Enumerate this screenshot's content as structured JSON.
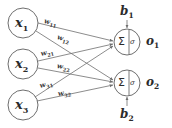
{
  "diagram": {
    "background_color": "#ffffff",
    "stroke_color": "#6e6e6e",
    "text_color": "#2b2b2b"
  },
  "inputs": [
    {
      "name": "input-x1",
      "label": "x",
      "sub": "1",
      "cx": 23,
      "cy": 23,
      "r": 15
    },
    {
      "name": "input-x2",
      "label": "x",
      "sub": "2",
      "cx": 23,
      "cy": 64,
      "r": 15
    },
    {
      "name": "input-x3",
      "label": "x",
      "sub": "3",
      "cx": 23,
      "cy": 105,
      "r": 15
    }
  ],
  "neurons": [
    {
      "name": "neuron-1",
      "sum_glyph": "Σ",
      "activation_glyph": "σ",
      "cx": 127,
      "cy": 42,
      "r": 13,
      "output_label": "o",
      "output_sub": "1",
      "bias_label": "b",
      "bias_sub": "1",
      "bias_position": "top"
    },
    {
      "name": "neuron-2",
      "sum_glyph": "Σ",
      "activation_glyph": "σ",
      "cx": 127,
      "cy": 83,
      "r": 13,
      "output_label": "o",
      "output_sub": "2",
      "bias_label": "b",
      "bias_sub": "2",
      "bias_position": "bottom"
    }
  ],
  "weights": [
    {
      "name": "weight-w11",
      "label": "w",
      "sub": "11",
      "from": "input-x1",
      "to": "neuron-1",
      "x": 48,
      "y": 22,
      "rotate": 12
    },
    {
      "name": "weight-w12",
      "label": "w",
      "sub": "12",
      "from": "input-x1",
      "to": "neuron-2",
      "x": 60,
      "y": 37,
      "rotate": 18
    },
    {
      "name": "weight-w21",
      "label": "w",
      "sub": "21",
      "from": "input-x2",
      "to": "neuron-1",
      "x": 44,
      "y": 52,
      "rotate": -14
    },
    {
      "name": "weight-w22",
      "label": "w",
      "sub": "22",
      "from": "input-x2",
      "to": "neuron-2",
      "x": 59,
      "y": 66,
      "rotate": 9
    },
    {
      "name": "weight-w31",
      "label": "w",
      "sub": "31",
      "from": "input-x3",
      "to": "neuron-1",
      "x": 43,
      "y": 85,
      "rotate": -16
    },
    {
      "name": "weight-w32",
      "label": "w",
      "sub": "32",
      "from": "input-x3",
      "to": "neuron-2",
      "x": 60,
      "y": 92,
      "rotate": -10
    }
  ],
  "edges": [
    {
      "name": "edge-x1-n1",
      "x1": 38,
      "y1": 23,
      "x2": 114,
      "y2": 41
    },
    {
      "name": "edge-x1-n2",
      "x1": 37,
      "y1": 30,
      "x2": 114,
      "y2": 80
    },
    {
      "name": "edge-x2-n1",
      "x1": 38,
      "y1": 62,
      "x2": 114,
      "y2": 44
    },
    {
      "name": "edge-x2-n2",
      "x1": 38,
      "y1": 68,
      "x2": 114,
      "y2": 82
    },
    {
      "name": "edge-x3-n1",
      "x1": 36,
      "y1": 98,
      "x2": 114,
      "y2": 46
    },
    {
      "name": "edge-x3-n2",
      "x1": 38,
      "y1": 102,
      "x2": 114,
      "y2": 85
    }
  ],
  "bias_arrows": [
    {
      "name": "bias-arrow-1",
      "x1": 127,
      "y1": 20,
      "x2": 127,
      "y2": 28
    },
    {
      "name": "bias-arrow-2",
      "x1": 127,
      "y1": 105,
      "x2": 127,
      "y2": 97
    }
  ]
}
